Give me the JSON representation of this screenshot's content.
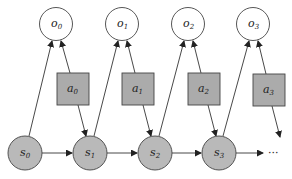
{
  "diagram": {
    "type": "POMDP graphical model",
    "colors": {
      "observation_fill": "#ffffff",
      "state_fill": "#b9b9b9",
      "action_fill": "#ababab",
      "stroke": "#444444"
    },
    "observations": [
      {
        "base": "o",
        "sub": "0",
        "cx": 56,
        "cy": 24
      },
      {
        "base": "o",
        "sub": "1",
        "cx": 122,
        "cy": 24
      },
      {
        "base": "o",
        "sub": "2",
        "cx": 188,
        "cy": 24
      },
      {
        "base": "o",
        "sub": "3",
        "cx": 253,
        "cy": 24
      }
    ],
    "actions": [
      {
        "base": "a",
        "sub": "0",
        "x": 57,
        "y": 73
      },
      {
        "base": "a",
        "sub": "1",
        "x": 122,
        "y": 73
      },
      {
        "base": "a",
        "sub": "2",
        "x": 188,
        "y": 73
      },
      {
        "base": "a",
        "sub": "3",
        "x": 253,
        "y": 74
      }
    ],
    "states": [
      {
        "base": "s",
        "sub": "0",
        "cx": 25,
        "cy": 153
      },
      {
        "base": "s",
        "sub": "1",
        "cx": 90,
        "cy": 153
      },
      {
        "base": "s",
        "sub": "2",
        "cx": 155,
        "cy": 153
      },
      {
        "base": "s",
        "sub": "3",
        "cx": 219,
        "cy": 153
      }
    ],
    "ellipsis": "···"
  }
}
